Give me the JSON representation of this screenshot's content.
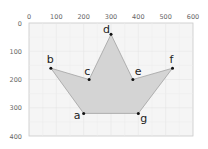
{
  "chart_data": {
    "type": "scatter",
    "title": "",
    "xlabel": "",
    "ylabel": "",
    "xlim": [
      0,
      600
    ],
    "ylim": [
      400,
      0
    ],
    "x_ticks": [
      "0",
      "100",
      "200",
      "300",
      "400",
      "500",
      "600"
    ],
    "y_ticks": [
      "0",
      "100",
      "200",
      "300",
      "400"
    ],
    "x_axis_position": "top",
    "y_axis_inverted": true,
    "grid": true,
    "polygon_fill": "#d4d4d4",
    "polygon_stroke": "#9a9a9a",
    "plot_background": "#f5f5f5",
    "points": [
      {
        "label": "a",
        "x": 200,
        "y": 320
      },
      {
        "label": "b",
        "x": 80,
        "y": 160
      },
      {
        "label": "c",
        "x": 220,
        "y": 200
      },
      {
        "label": "d",
        "x": 300,
        "y": 40
      },
      {
        "label": "e",
        "x": 380,
        "y": 200
      },
      {
        "label": "f",
        "x": 525,
        "y": 160
      },
      {
        "label": "g",
        "x": 400,
        "y": 320
      }
    ],
    "polygon_order": [
      "a",
      "b",
      "c",
      "d",
      "e",
      "f",
      "g"
    ]
  }
}
